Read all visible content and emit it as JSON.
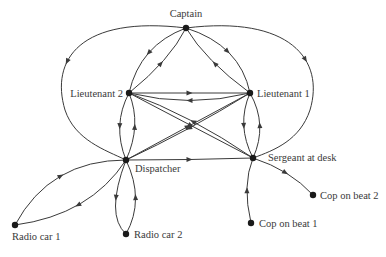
{
  "diagram": {
    "type": "directed-communication-network",
    "nodes": [
      {
        "id": "captain",
        "label": "Captain",
        "x": 186,
        "y": 28,
        "lx": 186,
        "ly": 17,
        "anchor": "middle"
      },
      {
        "id": "lieutenant2",
        "label": "Lieutenant 2",
        "x": 129,
        "y": 93,
        "lx": 123,
        "ly": 97,
        "anchor": "end"
      },
      {
        "id": "lieutenant1",
        "label": "Lieutenant 1",
        "x": 250,
        "y": 93,
        "lx": 257,
        "ly": 97,
        "anchor": "start"
      },
      {
        "id": "dispatcher",
        "label": "Dispatcher",
        "x": 126,
        "y": 160,
        "lx": 135,
        "ly": 172,
        "anchor": "start"
      },
      {
        "id": "sergeant",
        "label": "Sergeant at desk",
        "x": 253,
        "y": 158,
        "lx": 268,
        "ly": 161,
        "anchor": "start"
      },
      {
        "id": "radiocar1",
        "label": "Radio car 1",
        "x": 15,
        "y": 225,
        "lx": 12,
        "ly": 240,
        "anchor": "start"
      },
      {
        "id": "radiocar2",
        "label": "Radio car 2",
        "x": 126,
        "y": 234,
        "lx": 134,
        "ly": 238,
        "anchor": "start"
      },
      {
        "id": "copbeat1",
        "label": "Cop on beat 1",
        "x": 251,
        "y": 223,
        "lx": 259,
        "ly": 227,
        "anchor": "start"
      },
      {
        "id": "copbeat2",
        "label": "Cop on beat 2",
        "x": 313,
        "y": 195,
        "lx": 320,
        "ly": 199,
        "anchor": "start"
      }
    ],
    "edges": [
      {
        "from": "captain",
        "to": "lieutenant2",
        "d": "M186,28 Q140,45 129,93"
      },
      {
        "from": "lieutenant2",
        "to": "captain",
        "d": "M129,93 Q170,60 186,28"
      },
      {
        "from": "captain",
        "to": "lieutenant1",
        "d": "M186,28 Q240,45 250,93"
      },
      {
        "from": "lieutenant1",
        "to": "captain",
        "d": "M250,93 Q205,60 186,28"
      },
      {
        "from": "captain",
        "to": "dispatcher",
        "d": "M186,28 C80,15 50,60 65,110 C75,140 105,150 126,160"
      },
      {
        "from": "captain",
        "to": "sergeant",
        "d": "M186,28 C290,15 325,60 310,110 C300,140 275,150 253,158"
      },
      {
        "from": "lieutenant2",
        "to": "lieutenant1",
        "d": "M129,93 L250,93"
      },
      {
        "from": "lieutenant1",
        "to": "lieutenant2",
        "d": "M250,93 Q190,108 129,93"
      },
      {
        "from": "lieutenant2",
        "to": "dispatcher",
        "d": "M129,93 Q112,125 126,160"
      },
      {
        "from": "dispatcher",
        "to": "lieutenant2",
        "d": "M126,160 Q142,125 129,93"
      },
      {
        "from": "lieutenant1",
        "to": "sergeant",
        "d": "M250,93 Q236,125 253,158"
      },
      {
        "from": "sergeant",
        "to": "lieutenant1",
        "d": "M253,158 Q268,125 250,93"
      },
      {
        "from": "lieutenant2",
        "to": "sergeant",
        "d": "M129,93 L253,158"
      },
      {
        "from": "sergeant",
        "to": "lieutenant2",
        "d": "M253,158 Q190,115 129,93"
      },
      {
        "from": "lieutenant1",
        "to": "dispatcher",
        "d": "M250,93 Q190,130 126,160"
      },
      {
        "from": "dispatcher",
        "to": "lieutenant1",
        "d": "M126,160 L250,93"
      },
      {
        "from": "dispatcher",
        "to": "sergeant",
        "d": "M126,160 Q190,160 253,158"
      },
      {
        "from": "dispatcher",
        "to": "radiocar1",
        "d": "M126,160 Q90,215 15,225"
      },
      {
        "from": "radiocar1",
        "to": "dispatcher",
        "d": "M15,225 Q50,160 126,160"
      },
      {
        "from": "dispatcher",
        "to": "radiocar2",
        "d": "M126,160 Q105,215 126,234"
      },
      {
        "from": "radiocar2",
        "to": "dispatcher",
        "d": "M126,234 Q145,200 126,160"
      },
      {
        "from": "copbeat1",
        "to": "sergeant",
        "d": "M251,223 Q242,185 253,158"
      },
      {
        "from": "sergeant",
        "to": "copbeat2",
        "d": "M253,158 Q290,170 313,195"
      }
    ],
    "colors": {
      "line": "#3a3a3a",
      "node": "#1a1a1a",
      "text": "#3a3a3a",
      "background": "#ffffff"
    }
  }
}
